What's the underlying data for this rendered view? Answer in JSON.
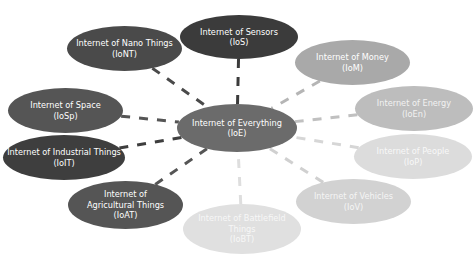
{
  "diagram": {
    "top_text": "...",
    "center": {
      "id": "ioe",
      "label": "Internet of Everything",
      "abbr": "(IoE)",
      "color": "#6b6b6b",
      "text_color": "#ffffff",
      "x": 177,
      "y": 104,
      "w": 120,
      "h": 48
    },
    "nodes": [
      {
        "id": "ios",
        "label": "Internet of Sensors",
        "abbr": "(IoS)",
        "color": "#3b3b3b",
        "text_color": "#ffffff",
        "x": 180,
        "y": 15,
        "w": 118,
        "h": 44,
        "line_color": "#3b3b3b"
      },
      {
        "id": "iont",
        "label": "Internet of Nano Things",
        "abbr": "(IoNT)",
        "color": "#4a4a4a",
        "text_color": "#ffffff",
        "x": 67,
        "y": 26,
        "w": 115,
        "h": 45,
        "line_color": "#4a4a4a"
      },
      {
        "id": "iosp",
        "label": "Internet of Space",
        "abbr": "(IoSp)",
        "color": "#555555",
        "text_color": "#ffffff",
        "x": 8,
        "y": 88,
        "w": 115,
        "h": 45,
        "line_color": "#555555"
      },
      {
        "id": "ioit",
        "label": "Internet of Industrial Things",
        "abbr": "(IoIT)",
        "color": "#3e3e3e",
        "text_color": "#ffffff",
        "x": 3,
        "y": 135,
        "w": 122,
        "h": 45,
        "line_color": "#3e3e3e"
      },
      {
        "id": "ioat",
        "label": "Internet of Agricultural Things",
        "abbr": "(IoAT)",
        "color": "#555555",
        "text_color": "#ffffff",
        "x": 68,
        "y": 181,
        "w": 115,
        "h": 48,
        "line_color": "#555555",
        "wrap": true
      },
      {
        "id": "iobt",
        "label": "Internet of Battlefield Things",
        "abbr": "(IoBT)",
        "color": "#e0e0e0",
        "text_color": "#f7f7f7",
        "x": 183,
        "y": 204,
        "w": 118,
        "h": 50,
        "line_color": "#dedede",
        "wrap": true
      },
      {
        "id": "iom",
        "label": "Internet of Money",
        "abbr": "(IoM)",
        "color": "#a9a9a9",
        "text_color": "#ffffff",
        "x": 295,
        "y": 40,
        "w": 115,
        "h": 45,
        "line_color": "#b5b5b5"
      },
      {
        "id": "ioen",
        "label": "Internet of Energy",
        "abbr": "(IoEn)",
        "color": "#bdbdbd",
        "text_color": "#f2f2f2",
        "x": 355,
        "y": 86,
        "w": 118,
        "h": 45,
        "line_color": "#c0c0c0"
      },
      {
        "id": "iop",
        "label": "Internet of People",
        "abbr": "(IoP)",
        "color": "#dcdcdc",
        "text_color": "#f8f8f8",
        "x": 354,
        "y": 134,
        "w": 118,
        "h": 45,
        "line_color": "#d6d6d6"
      },
      {
        "id": "iov",
        "label": "Internet of Vehicles",
        "abbr": "(IoV)",
        "color": "#d2d2d2",
        "text_color": "#f5f5f5",
        "x": 296,
        "y": 179,
        "w": 115,
        "h": 45,
        "line_color": "#d0d0d0"
      }
    ]
  }
}
